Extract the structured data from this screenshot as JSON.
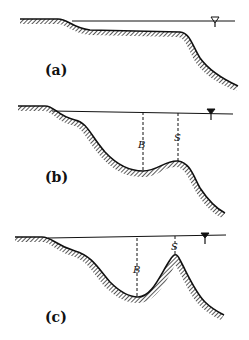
{
  "figure": {
    "panels": [
      {
        "id": "a",
        "label": "(a)",
        "water_symbol": "water-level-triangle",
        "dimensions": []
      },
      {
        "id": "b",
        "label": "(b)",
        "water_symbol": "water-level-triangle",
        "dimensions": [
          {
            "label": "B"
          },
          {
            "label": "S"
          }
        ]
      },
      {
        "id": "c",
        "label": "(c)",
        "water_symbol": "water-level-triangle",
        "dimensions": [
          {
            "label": "B"
          },
          {
            "label": "S"
          }
        ]
      }
    ],
    "colors": {
      "ink": "#111111",
      "background": "#ffffff"
    }
  }
}
